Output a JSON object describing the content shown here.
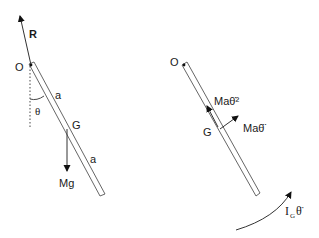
{
  "diagram": {
    "type": "free-body / kinetic diagram of a pendulum rod",
    "left_figure": {
      "description": "Free-body diagram",
      "pivot_label": "O",
      "reaction_label": "R",
      "angle_label": "θ",
      "upper_half_label": "a",
      "lower_half_label": "a",
      "centre_label": "G",
      "weight_label": "Mg"
    },
    "right_figure": {
      "description": "Kinetic (effective force) diagram",
      "pivot_label": "O",
      "centre_label": "G",
      "centripetal_label": "Maθ̇²",
      "tangential_label": "Maθ̈",
      "moment_label_main": "I",
      "moment_label_sub": "G",
      "moment_label_theta": "θ̈"
    },
    "colors": {
      "line": "#333333",
      "rod_outline": "#555555",
      "background": "#ffffff"
    }
  }
}
